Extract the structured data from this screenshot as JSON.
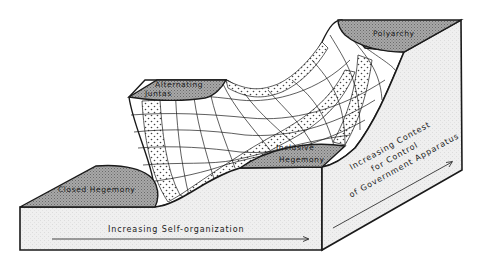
{
  "diagram": {
    "type": "block-diagram-landscape",
    "regimes": [
      {
        "id": "closed-hegemony",
        "label": "Closed Hegemony",
        "position": "front-left-low"
      },
      {
        "id": "alternating-juntas-1",
        "label": "Alternating",
        "position": "back-left-high"
      },
      {
        "id": "alternating-juntas-2",
        "label": "Juntas",
        "position": "back-left-high"
      },
      {
        "id": "inclusive-hegemony-1",
        "label": "Inclusive",
        "position": "front-right-mid"
      },
      {
        "id": "inclusive-hegemony-2",
        "label": "Hegemony",
        "position": "front-right-mid"
      },
      {
        "id": "polyarchy",
        "label": "Polyarchy",
        "position": "back-right-highest"
      }
    ],
    "labels": {
      "closed_hegemony": "Closed Hegemony",
      "alternating": "Alternating",
      "juntas": "Juntas",
      "inclusive": "Inclusive",
      "hegemony": "Hegemony",
      "polyarchy": "Polyarchy"
    },
    "axes": {
      "front": "Increasing Self-organization",
      "side_line1": "Increasing Contest",
      "side_line2": "for Control",
      "side_line3": "of Government Apparatus"
    },
    "colors": {
      "outline": "#1a1a1a",
      "plateau_fill": "#9a9a9a",
      "block_face": "#ececec",
      "surface": "#ffffff",
      "dots": "#444444"
    }
  }
}
